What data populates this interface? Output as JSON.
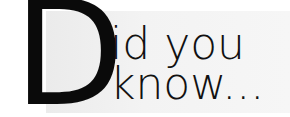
{
  "heading": {
    "drop_cap": "D",
    "line1": "id you",
    "line2": "know..."
  },
  "colors": {
    "text": "#111111",
    "panel": "#f2f2f2",
    "background": "#ffffff"
  }
}
